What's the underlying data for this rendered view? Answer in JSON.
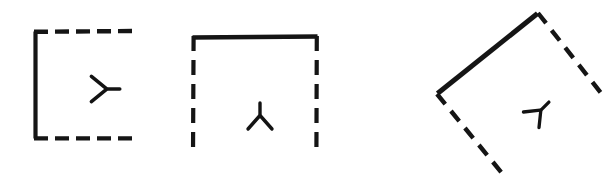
{
  "figure": {
    "title": "Three partially-drawn squares with orientation markers",
    "background_color": "#ffffff",
    "ink_color": "#151515",
    "width": 615,
    "height": 175,
    "style": "hand-drawn scanned line art",
    "shape_count": 3,
    "shapes": [
      {
        "id": "square-left",
        "label": "Left square",
        "orientation_deg": 0,
        "marker": {
          "name": "y-marker",
          "label": "Y glyph",
          "rotation_deg": -90,
          "description": "three-pronged Y shape pointing right",
          "center_x": 104,
          "center_y": 89
        },
        "geometry": {
          "left": 34,
          "top": 31,
          "right": 133,
          "bottom": 138
        },
        "edges": [
          {
            "name": "top-edge",
            "style": "dashed",
            "present": true
          },
          {
            "name": "right-edge",
            "style": "none",
            "present": false
          },
          {
            "name": "bottom-edge",
            "style": "dashed",
            "present": true
          },
          {
            "name": "left-edge",
            "style": "solid",
            "present": true
          }
        ],
        "solid_edge": "left-edge",
        "missing_edge": "right-edge"
      },
      {
        "id": "square-middle",
        "label": "Middle square",
        "orientation_deg": 0,
        "marker": {
          "name": "y-marker",
          "label": "Y glyph",
          "rotation_deg": 180,
          "description": "three-pronged Y shape pointing down",
          "center_x": 260,
          "center_y": 118
        },
        "geometry": {
          "left": 192,
          "top": 36,
          "right": 318,
          "bottom": 152
        },
        "edges": [
          {
            "name": "top-edge",
            "style": "solid",
            "present": true
          },
          {
            "name": "right-edge",
            "style": "dashed",
            "present": true
          },
          {
            "name": "bottom-edge",
            "style": "none",
            "present": false
          },
          {
            "name": "left-edge",
            "style": "dashed",
            "present": true
          }
        ],
        "solid_edge": "top-edge",
        "missing_edge": "bottom-edge"
      },
      {
        "id": "square-right-rotated",
        "label": "Right rotated square",
        "orientation_deg": -45,
        "marker": {
          "name": "y-marker",
          "label": "Y glyph",
          "rotation_deg": -135,
          "description": "three-pronged Y shape tilted, pointing up-left",
          "center_x": 539,
          "center_y": 112
        },
        "geometry": {
          "vertex_top_x": 537,
          "vertex_top_y": 12,
          "vertex_left_x": 437,
          "vertex_left_y": 93,
          "vertex_right_x": 600,
          "vertex_right_y": 92,
          "vertex_bottom_x": 505,
          "vertex_bottom_y": 176
        },
        "edges": [
          {
            "name": "upper-left-edge",
            "style": "solid",
            "present": true
          },
          {
            "name": "upper-right-edge",
            "style": "dashed",
            "present": true
          },
          {
            "name": "lower-left-edge",
            "style": "dashed",
            "present": true
          },
          {
            "name": "lower-right-edge",
            "style": "none",
            "present": false
          }
        ],
        "solid_edge": "upper-left-edge",
        "missing_edge": "lower-right-edge"
      }
    ]
  }
}
